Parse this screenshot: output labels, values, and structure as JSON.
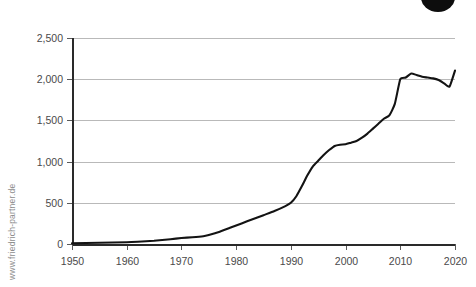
{
  "watermark": {
    "text": "www.friedrich-partner.de"
  },
  "decoration": {
    "corner_dot_name": "black-circle-badge",
    "corner_dot_color": "#0d0d0d"
  },
  "style": {
    "line_color": "#131313",
    "gridline_color": "#b9b9b9",
    "axis_color": "#2a2a2a",
    "label_color": "#4a4a4a",
    "background": "#ffffff"
  },
  "chart_data": {
    "type": "line",
    "title": "",
    "subtitle": "",
    "xlabel": "",
    "ylabel": "",
    "xlim": [
      1950,
      2020
    ],
    "ylim": [
      0,
      2500
    ],
    "grid": true,
    "legend": false,
    "legend_position": "none",
    "ytick_labels": [
      "0",
      "500",
      "1,000",
      "1,500",
      "2,000",
      "2,500"
    ],
    "ytick_values": [
      0,
      500,
      1000,
      1500,
      2000,
      2500
    ],
    "xtick_labels": [
      "1950",
      "1960",
      "1970",
      "1980",
      "1990",
      "2000",
      "2010",
      "2020"
    ],
    "xtick_values": [
      1950,
      1960,
      1970,
      1980,
      1990,
      2000,
      2010,
      2020
    ],
    "series": [
      {
        "name": "value",
        "x": [
          1950,
          1955,
          1960,
          1962,
          1965,
          1968,
          1970,
          1972,
          1974,
          1975,
          1977,
          1979,
          1981,
          1983,
          1985,
          1987,
          1989,
          1990,
          1991,
          1992,
          1993,
          1994,
          1995,
          1996,
          1997,
          1998,
          1999,
          2000,
          2001,
          2002,
          2003,
          2004,
          2005,
          2006,
          2007,
          2008,
          2009,
          2010,
          2011,
          2012,
          2013,
          2014,
          2015,
          2016,
          2017,
          2018,
          2019,
          2020
        ],
        "values": [
          10,
          15,
          22,
          28,
          40,
          58,
          72,
          82,
          95,
          110,
          150,
          200,
          250,
          300,
          350,
          400,
          460,
          500,
          580,
          700,
          830,
          940,
          1010,
          1080,
          1140,
          1190,
          1205,
          1210,
          1230,
          1250,
          1290,
          1340,
          1400,
          1460,
          1520,
          1560,
          1700,
          2000,
          2020,
          2070,
          2050,
          2030,
          2020,
          2010,
          1990,
          1950,
          1910,
          2105
        ]
      }
    ],
    "annotations": []
  }
}
